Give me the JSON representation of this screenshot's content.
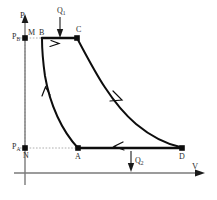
{
  "figure": {
    "kind": "pv-cycle-diagram",
    "axes": {
      "y_label": "P",
      "x_label": "V",
      "y_axis_x": 25,
      "x_axis_y": 173,
      "axis_color": "#7a7a7a"
    },
    "pressure_levels": [
      {
        "key": "pb",
        "label": "P",
        "sub": "B",
        "y": 38,
        "x": 14
      },
      {
        "key": "pa",
        "label": "P",
        "sub": "A",
        "y": 148,
        "x": 14
      }
    ],
    "points": [
      {
        "key": "M",
        "label": "M",
        "x": 25,
        "y": 38,
        "lx": 28,
        "ly": 30,
        "marker": true
      },
      {
        "key": "B",
        "label": "B",
        "x": 42,
        "y": 38,
        "lx": 39,
        "ly": 30,
        "marker": false
      },
      {
        "key": "C",
        "label": "C",
        "x": 77,
        "y": 38,
        "lx": 76,
        "ly": 28,
        "marker": true
      },
      {
        "key": "N",
        "label": "N",
        "x": 25,
        "y": 148,
        "lx": 23,
        "ly": 152,
        "marker": true
      },
      {
        "key": "A",
        "label": "A",
        "x": 78,
        "y": 148,
        "lx": 75,
        "ly": 153,
        "marker": true
      },
      {
        "key": "D",
        "label": "D",
        "x": 182,
        "y": 148,
        "lx": 179,
        "ly": 153,
        "marker": true
      }
    ],
    "heat_flows": [
      {
        "key": "q1",
        "label": "Q",
        "sub": "1",
        "lx": 57,
        "ly": 9,
        "arrow_x": 60,
        "arrow_y0": 17,
        "arrow_y1": 35
      },
      {
        "key": "q2",
        "label": "Q",
        "sub": "2",
        "lx": 134,
        "ly": 158,
        "arrow_x": 131,
        "arrow_y0": 152,
        "arrow_y1": 172
      }
    ],
    "segments": [
      {
        "key": "bc",
        "from": "B",
        "to": "C",
        "type": "isobaric-line",
        "direction": "right"
      },
      {
        "key": "cd",
        "from": "C",
        "to": "D",
        "type": "adiabatic-curve",
        "direction": "down-right"
      },
      {
        "key": "da",
        "from": "D",
        "to": "A",
        "type": "isobaric-line",
        "direction": "left"
      },
      {
        "key": "ab",
        "from": "A",
        "to": "B",
        "type": "adiabatic-curve",
        "direction": "up"
      }
    ],
    "colors": {
      "curve": "#0d0d0d",
      "axis": "#7a7a7a",
      "dotted": "#9a9a9a",
      "text": "#2b2b2b"
    }
  }
}
